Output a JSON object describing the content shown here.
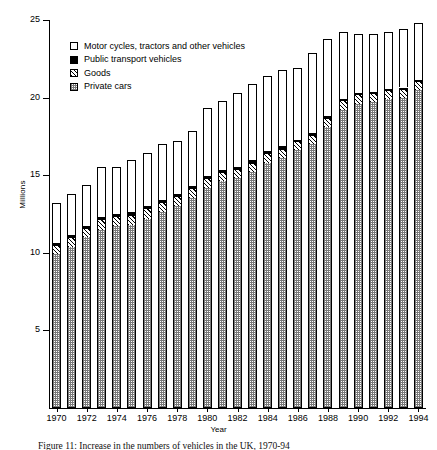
{
  "figure": {
    "caption": "Figure 11: Increase in the numbers of vehicles in the UK, 1970-94"
  },
  "legend": {
    "position": "upper-left-inside",
    "items": [
      {
        "label": "Motor cycles, tractors and other vehicles",
        "swatch": "open-white-square",
        "color": "#ffffff"
      },
      {
        "label": "Public transport vehicles",
        "swatch": "solid-black-square",
        "color": "#000000"
      },
      {
        "label": "Goods",
        "swatch": "diagonal-hatch-square",
        "color": "#000000"
      },
      {
        "label": "Private cars",
        "swatch": "stippled-square",
        "color": "#7a7a7a"
      }
    ]
  },
  "chart_data": {
    "type": "bar",
    "subtype": "stacked",
    "title": "",
    "xlabel": "Year",
    "ylabel": "Millions",
    "ylim": [
      0,
      25
    ],
    "yticks": [
      0,
      5,
      10,
      15,
      20,
      25
    ],
    "ytick_labels": [
      "",
      "5",
      "10",
      "15",
      "20",
      "25"
    ],
    "grid": false,
    "categories": [
      "1970",
      "1971",
      "1972",
      "1973",
      "1974",
      "1975",
      "1976",
      "1977",
      "1978",
      "1979",
      "1980",
      "1981",
      "1982",
      "1983",
      "1984",
      "1985",
      "1986",
      "1987",
      "1988",
      "1989",
      "1990",
      "1991",
      "1992",
      "1993",
      "1994"
    ],
    "xtick_labels": [
      "1970",
      "1972",
      "1974",
      "1976",
      "1978",
      "1980",
      "1982",
      "1984",
      "1986",
      "1988",
      "1990",
      "1992",
      "1994"
    ],
    "series": [
      {
        "name": "Private cars",
        "fill": "stippled",
        "values": [
          9.9,
          10.4,
          11.0,
          11.5,
          11.7,
          11.8,
          12.2,
          12.6,
          13.0,
          13.5,
          14.2,
          14.6,
          14.8,
          15.2,
          15.8,
          16.1,
          16.6,
          17.0,
          18.1,
          19.2,
          19.6,
          19.7,
          19.9,
          20.0,
          20.5
        ]
      },
      {
        "name": "Goods",
        "fill": "diagonal-hatch",
        "values": [
          0.55,
          0.55,
          0.55,
          0.6,
          0.6,
          0.6,
          0.6,
          0.6,
          0.6,
          0.6,
          0.55,
          0.55,
          0.55,
          0.55,
          0.55,
          0.55,
          0.55,
          0.55,
          0.55,
          0.55,
          0.55,
          0.5,
          0.5,
          0.5,
          0.5
        ]
      },
      {
        "name": "Public transport vehicles",
        "fill": "solid-black",
        "values": [
          0.2,
          0.2,
          0.2,
          0.2,
          0.2,
          0.2,
          0.2,
          0.2,
          0.2,
          0.2,
          0.2,
          0.2,
          0.2,
          0.2,
          0.2,
          0.2,
          0.15,
          0.15,
          0.15,
          0.15,
          0.15,
          0.15,
          0.15,
          0.15,
          0.15
        ]
      },
      {
        "name": "Motor cycles, tractors and other vehicles",
        "fill": "open-white",
        "values": [
          2.55,
          2.65,
          2.65,
          3.2,
          3.0,
          3.4,
          3.4,
          3.6,
          3.4,
          3.55,
          4.35,
          4.45,
          4.75,
          4.95,
          4.85,
          4.95,
          4.6,
          5.2,
          5.0,
          4.3,
          3.8,
          3.75,
          3.65,
          3.75,
          3.65
        ]
      }
    ],
    "totals": [
      13.2,
      13.8,
      14.4,
      15.5,
      15.5,
      16.0,
      16.4,
      17.0,
      17.2,
      17.85,
      19.3,
      19.8,
      20.3,
      20.9,
      21.4,
      21.8,
      21.9,
      22.9,
      23.8,
      24.2,
      24.1,
      24.1,
      24.2,
      24.4,
      24.8
    ]
  }
}
